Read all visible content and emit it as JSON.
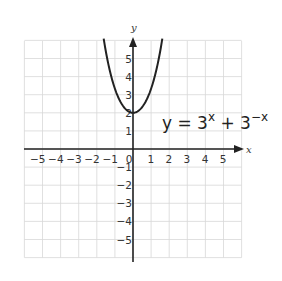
{
  "chart_data": {
    "type": "line",
    "title": "",
    "annotation": {
      "text_base": "y = 3",
      "sup1": "x",
      "mid": " + 3",
      "sup2": "−x"
    },
    "xlabel": "x",
    "ylabel": "y",
    "xlim": [
      -6,
      6
    ],
    "ylim": [
      -6,
      6
    ],
    "grid": true,
    "x_ticks": [
      "−5",
      "−4",
      "−3",
      "−2",
      "−1",
      "0",
      "1",
      "2",
      "3",
      "4",
      "5"
    ],
    "y_ticks": [
      "5",
      "4",
      "3",
      "2",
      "1",
      "−1",
      "−2",
      "−3",
      "−4",
      "−5"
    ],
    "series": [
      {
        "name": "y = 3^x + 3^-x",
        "x": [
          -1.6,
          -1.5,
          -1.25,
          -1,
          -0.75,
          -0.5,
          -0.25,
          0,
          0.25,
          0.5,
          0.75,
          1,
          1.25,
          1.5,
          1.6
        ],
        "y": [
          6.0,
          5.39,
          4.35,
          3.33,
          2.71,
          2.31,
          2.07,
          2.0,
          2.07,
          2.31,
          2.71,
          3.33,
          4.35,
          5.39,
          6.0
        ]
      }
    ]
  },
  "colors": {
    "grid": "#d8d8d8",
    "axis": "#222222",
    "curve": "#222222"
  }
}
